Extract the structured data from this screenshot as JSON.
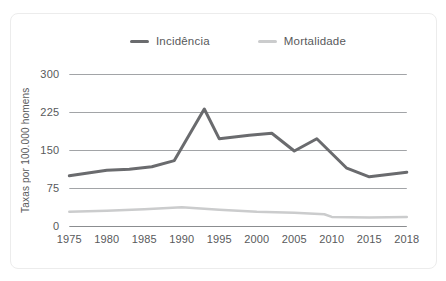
{
  "chart_data": {
    "type": "line",
    "title": "",
    "xlabel": "",
    "ylabel": "Taxas por 100.000 homens",
    "x_ticks": [
      1975,
      1980,
      1985,
      1990,
      1995,
      2000,
      2005,
      2010,
      2015,
      2018
    ],
    "y_ticks": [
      0,
      75,
      150,
      225,
      300
    ],
    "ylim": [
      0,
      300
    ],
    "grid": "horizontal",
    "legend_position": "top-center",
    "text_color": "#58595b",
    "grid_color": "#a2a4a7",
    "axis_line_color": "#8b8d90",
    "series": [
      {
        "name": "Incidência",
        "color": "#6a6b6e",
        "stroke_width": 3,
        "points": [
          [
            1975,
            100
          ],
          [
            1980,
            111
          ],
          [
            1983,
            113
          ],
          [
            1986,
            118
          ],
          [
            1989,
            130
          ],
          [
            1993,
            232
          ],
          [
            1995,
            173
          ],
          [
            1999,
            180
          ],
          [
            2002,
            184
          ],
          [
            2005,
            149
          ],
          [
            2008,
            173
          ],
          [
            2012,
            115
          ],
          [
            2015,
            98
          ],
          [
            2018,
            107
          ]
        ]
      },
      {
        "name": "Mortalidade",
        "color": "#cbcccd",
        "stroke_width": 2.5,
        "points": [
          [
            1975,
            29
          ],
          [
            1980,
            31
          ],
          [
            1985,
            34
          ],
          [
            1990,
            38
          ],
          [
            1995,
            33
          ],
          [
            2000,
            29
          ],
          [
            2005,
            27
          ],
          [
            2009,
            24
          ],
          [
            2010,
            19
          ],
          [
            2015,
            18
          ],
          [
            2018,
            19
          ]
        ]
      }
    ]
  }
}
